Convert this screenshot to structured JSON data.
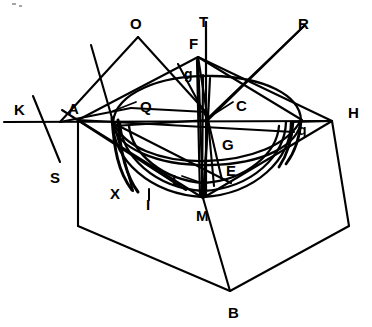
{
  "figure": {
    "stroke_color": "#000000",
    "background_color": "#ffffff",
    "width": 372,
    "height": 327,
    "labels": [
      {
        "id": "label-O",
        "text": "O",
        "x": 130,
        "y": 16,
        "size": "upper"
      },
      {
        "id": "label-T",
        "text": "T",
        "x": 199,
        "y": 14,
        "size": "upper"
      },
      {
        "id": "label-R",
        "text": "R",
        "x": 298,
        "y": 16,
        "size": "upper"
      },
      {
        "id": "label-F",
        "text": "F",
        "x": 189,
        "y": 36,
        "size": "upper"
      },
      {
        "id": "label-g",
        "text": "g",
        "x": 184,
        "y": 67,
        "size": "lower"
      },
      {
        "id": "label-Q",
        "text": "Q",
        "x": 140,
        "y": 99,
        "size": "upper"
      },
      {
        "id": "label-C",
        "text": "C",
        "x": 236,
        "y": 98,
        "size": "upper"
      },
      {
        "id": "label-K",
        "text": "K",
        "x": 14,
        "y": 102,
        "size": "upper"
      },
      {
        "id": "label-A",
        "text": "A",
        "x": 68,
        "y": 101,
        "size": "upper"
      },
      {
        "id": "label-H",
        "text": "H",
        "x": 348,
        "y": 105,
        "size": "upper"
      },
      {
        "id": "label-q",
        "text": "q",
        "x": 298,
        "y": 123,
        "size": "lower"
      },
      {
        "id": "label-G",
        "text": "G",
        "x": 222,
        "y": 137,
        "size": "upper"
      },
      {
        "id": "label-E",
        "text": "E",
        "x": 226,
        "y": 163,
        "size": "upper"
      },
      {
        "id": "label-S",
        "text": "S",
        "x": 50,
        "y": 170,
        "size": "upper"
      },
      {
        "id": "label-L",
        "text": "L",
        "x": 172,
        "y": 172,
        "size": "upper"
      },
      {
        "id": "label-X",
        "text": "X",
        "x": 110,
        "y": 186,
        "size": "upper"
      },
      {
        "id": "label-I",
        "text": "I",
        "x": 146,
        "y": 197,
        "size": "upper"
      },
      {
        "id": "label-M",
        "text": "M",
        "x": 196,
        "y": 208,
        "size": "upper"
      },
      {
        "id": "label-B",
        "text": "B",
        "x": 228,
        "y": 305,
        "size": "upper"
      }
    ],
    "annotations": {
      "leader_Q": "pointer from label Q to upper ellipse arc",
      "leader_C": "pointer from label C to apex convergence point",
      "leader_L": "pointer from label L to lower ellipse arc"
    }
  }
}
